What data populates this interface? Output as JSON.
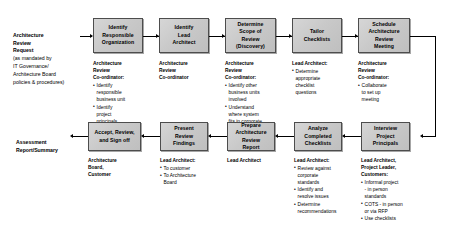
{
  "diagram": {
    "accent_color": "#c9c9c9",
    "border_color": "#4d4d4d",
    "line_color": "#000000"
  },
  "terminators": {
    "request": {
      "title": "Architecture\nReview\nRequest",
      "detail": "(as mandated by\nIT Governance/\nArchitecture Board\npolicies & procedures)"
    },
    "output": {
      "title": "Assessment\nReport/Summary"
    }
  },
  "nodes": [
    {
      "id": "identify-responsible-organization",
      "label": "Identify\nResponsible\nOrganization"
    },
    {
      "id": "identify-lead-architect",
      "label": "Identify\nLead\nArchitect"
    },
    {
      "id": "determine-scope-of-review",
      "label": "Determine\nScope of\nReview\n(Discovery)"
    },
    {
      "id": "tailor-checklists",
      "label": "Tailor\nChecklists"
    },
    {
      "id": "schedule-architecture-review-meeting",
      "label": "Schedule\nArchitecture\nReview\nMeeting"
    },
    {
      "id": "interview-project-principals",
      "label": "Interview\nProject\nPrincipals"
    },
    {
      "id": "analyze-completed-checklists",
      "label": "Analyze\nCompleted\nChecklists"
    },
    {
      "id": "prepare-architecture-review-report",
      "label": "Prepare\nArchitecture\nReview\nReport"
    },
    {
      "id": "present-review-findings",
      "label": "Present\nReview\nFindings"
    },
    {
      "id": "accept-review-and-sign-off",
      "label": "Accept, Review,\nand Sign off"
    }
  ],
  "annotations": [
    {
      "id": "identify-responsible-organization",
      "role": "Architecture\nReview\nCo-ordinator:",
      "bullets": [
        "Identify\nresponsible\nbusiness unit",
        "Identify\nproject\nprincipals"
      ]
    },
    {
      "id": "identify-lead-architect",
      "role": "Architecture\nReview\nCo-ordinator",
      "bullets": []
    },
    {
      "id": "determine-scope-of-review",
      "role": "Architecture\nReview\nCo-ordinator:",
      "bullets": [
        "Identify other\nbusiness units\ninvolved",
        "Understand\nwhere system\nfits in corporate\nframework"
      ]
    },
    {
      "id": "tailor-checklists",
      "role": "Lead Architect:",
      "bullets": [
        "Determine\nappropriate\nchecklist\nquestions"
      ]
    },
    {
      "id": "schedule-architecture-review-meeting",
      "role": "Architecture\nReview\nCo-ordinator:",
      "bullets": [
        "Collaborate\nto set up\nmeeting"
      ]
    },
    {
      "id": "interview-project-principals",
      "role": "Lead Architect,\nProject Leader,\nCustomers:",
      "bullets": [
        "Informal project\n- in person\nstandards",
        "COTS - in person\nor via RFP",
        "Use checklists"
      ]
    },
    {
      "id": "analyze-completed-checklists",
      "role": "Lead Architect:",
      "bullets": [
        "Review against\ncorporate\nstandards",
        "Identify and\nresolve issues",
        "Determine\nrecommendations"
      ]
    },
    {
      "id": "prepare-architecture-review-report",
      "role": "Lead Architect",
      "bullets": []
    },
    {
      "id": "present-review-findings",
      "role": "Lead Architect:",
      "bullets": [
        "To customer",
        "To Architecture\nBoard"
      ]
    },
    {
      "id": "accept-review-and-sign-off",
      "role": "Architecture\nBoard,\nCustomer",
      "bullets": []
    }
  ]
}
